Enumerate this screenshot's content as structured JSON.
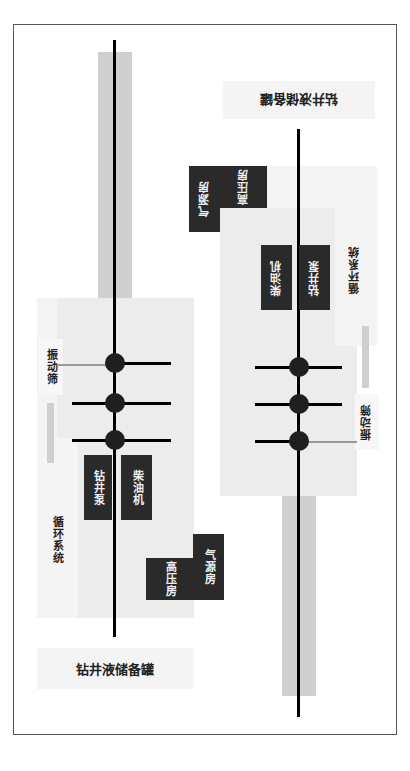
{
  "diagram": {
    "left_rig": {
      "tank_label": "钻井液储备罐",
      "circulation_label": "循环系统",
      "shaker_label": "振动筛",
      "pump_label": "钻井泵",
      "engine_label": "柴油机",
      "high_pressure_label": "高压房",
      "air_source_label": "气源房",
      "wellhead_count": 3
    },
    "right_rig": {
      "tank_label": "钻井液储备罐",
      "circulation_label": "循环系统",
      "shaker_label": "振动筛",
      "pump_label": "钻井泵",
      "engine_label": "柴油机",
      "high_pressure_label": "高压房",
      "air_source_label": "气源房",
      "wellhead_count": 3
    },
    "colors": {
      "rail": "#cfcfcf",
      "zone": "#ececec",
      "block": "#2a2a2a",
      "line": "#000000"
    }
  }
}
